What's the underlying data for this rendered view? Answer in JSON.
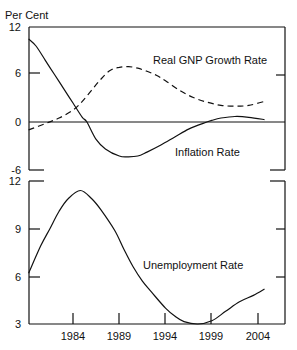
{
  "chart_data": [
    {
      "type": "line",
      "title": "",
      "ylabel": "Per Cent",
      "xlabel": "",
      "ylim": [
        -6,
        12
      ],
      "yticks": [
        12,
        6,
        0,
        -6
      ],
      "xlim": [
        1979.2,
        2007
      ],
      "grid": false,
      "zero_line": true,
      "series": [
        {
          "name": "Real GNP Growth Rate",
          "style": "dashed",
          "x": [
            1979.2,
            1981,
            1982.5,
            1984,
            1985,
            1986,
            1987,
            1988,
            1989,
            1990,
            1991,
            1992,
            1993,
            1994,
            1995.5,
            1997,
            1998.5,
            2000,
            2001.5,
            2003,
            2004.7
          ],
          "values": [
            -1.0,
            -0.2,
            0.5,
            1.5,
            2.6,
            4.0,
            5.4,
            6.5,
            6.9,
            7.0,
            6.8,
            6.4,
            5.9,
            5.2,
            4.0,
            3.1,
            2.5,
            2.1,
            2.0,
            2.1,
            2.6
          ]
        },
        {
          "name": "Inflation Rate",
          "style": "solid",
          "x": [
            1979.2,
            1980,
            1981,
            1982,
            1983,
            1984,
            1985,
            1985.5,
            1986.5,
            1987.5,
            1989,
            1990,
            1991,
            1992,
            1993.5,
            1995,
            1996.5,
            1998,
            1999,
            2000,
            2001.5,
            2003,
            2004.7
          ],
          "values": [
            10.5,
            9.6,
            7.8,
            6.0,
            4.2,
            2.4,
            0.6,
            0.0,
            -2.2,
            -3.4,
            -4.3,
            -4.4,
            -4.3,
            -3.8,
            -2.9,
            -1.9,
            -0.9,
            -0.2,
            0.2,
            0.5,
            0.7,
            0.6,
            0.3
          ]
        }
      ],
      "annotations": [
        "Real GNP Growth Rate",
        "Inflation Rate"
      ]
    },
    {
      "type": "line",
      "title": "",
      "ylabel": "",
      "xlabel": "",
      "ylim": [
        3,
        12
      ],
      "yticks": [
        12,
        9,
        6,
        3
      ],
      "xticks": [
        1984,
        1989,
        1994,
        1999,
        2004
      ],
      "xlim": [
        1979.2,
        2007
      ],
      "grid": false,
      "series": [
        {
          "name": "Unemployment Rate",
          "style": "solid",
          "x": [
            1979.2,
            1980.5,
            1981.5,
            1982.5,
            1983.5,
            1984.8,
            1986,
            1987,
            1988.5,
            1989.5,
            1990.5,
            1991.5,
            1992.5,
            1994,
            1995,
            1996,
            1997.5,
            1999,
            2000.5,
            2002,
            2003.5,
            2004.7
          ],
          "values": [
            6.2,
            7.9,
            9.0,
            10.1,
            10.9,
            11.4,
            10.9,
            10.2,
            8.9,
            7.7,
            6.6,
            5.7,
            5.0,
            4.0,
            3.5,
            3.15,
            3.0,
            3.2,
            3.8,
            4.4,
            4.8,
            5.2
          ]
        }
      ],
      "annotations": [
        "Unemployment Rate"
      ]
    }
  ],
  "labels": {
    "y_unit": "Per Cent",
    "top_y_ticks": [
      "12",
      "6",
      "0",
      "-6"
    ],
    "bottom_y_ticks": [
      "12",
      "9",
      "6",
      "3"
    ],
    "x_ticks": [
      "1984",
      "1989",
      "1994",
      "1999",
      "2004"
    ],
    "gnp_label": "Real GNP Growth Rate",
    "inflation_label": "Inflation Rate",
    "unemployment_label": "Unemployment Rate"
  }
}
